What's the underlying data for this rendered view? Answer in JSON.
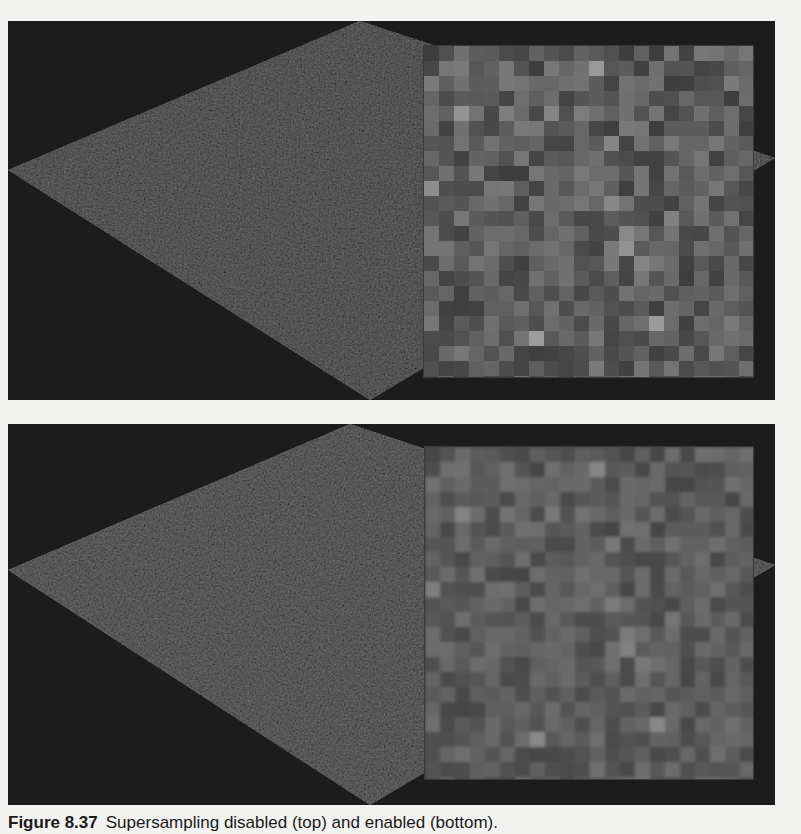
{
  "figure": {
    "panels": [
      {
        "id": "top",
        "description": "Supersampling disabled",
        "top": 21,
        "height": 379,
        "diamond": [
          [
            0,
            149
          ],
          [
            352,
            0
          ],
          [
            767,
            137
          ],
          [
            362,
            379
          ]
        ],
        "inset": {
          "x": 416,
          "y": 25,
          "w": 329,
          "h": 331,
          "block": 15,
          "blur": 0
        },
        "colors": {
          "background": "#1c1c1c",
          "diamond": "#5a5a5a",
          "inset_base": "#5c5c5c",
          "inset_border": "#3a3a3a"
        }
      },
      {
        "id": "bottom",
        "description": "Supersampling enabled",
        "top": 424,
        "height": 381,
        "diamond": [
          [
            0,
            146
          ],
          [
            342,
            0
          ],
          [
            767,
            141
          ],
          [
            362,
            381
          ]
        ],
        "inset": {
          "x": 417,
          "y": 23,
          "w": 328,
          "h": 332,
          "block": 15,
          "blur": 1.6
        },
        "colors": {
          "background": "#1c1c1c",
          "diamond": "#5e5e5e",
          "inset_base": "#5e5e5e",
          "inset_border": "#3a3a3a"
        }
      }
    ],
    "caption": {
      "label": "Figure 8.37",
      "text": "Supersampling disabled (top) and enabled (bottom)."
    }
  }
}
